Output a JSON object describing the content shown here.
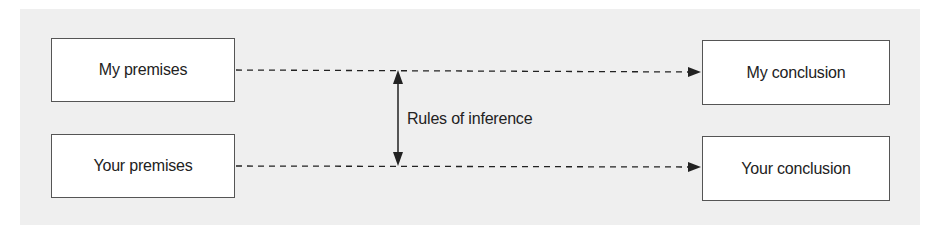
{
  "diagram": {
    "nodes": [
      {
        "id": "my_premises",
        "label": "My premises"
      },
      {
        "id": "your_premises",
        "label": "Your premises"
      },
      {
        "id": "my_conclusion",
        "label": "My conclusion"
      },
      {
        "id": "your_conclusion",
        "label": "Your conclusion"
      }
    ],
    "edges": [
      {
        "from": "my_premises",
        "to": "my_conclusion",
        "style": "dashed",
        "arrow": "end"
      },
      {
        "from": "your_premises",
        "to": "your_conclusion",
        "style": "dashed",
        "arrow": "end"
      }
    ],
    "connector": {
      "label": "Rules of inference",
      "style": "solid",
      "arrow": "both"
    },
    "colors": {
      "background": "#efefef",
      "box": "#ffffff",
      "stroke": "#222222"
    }
  }
}
